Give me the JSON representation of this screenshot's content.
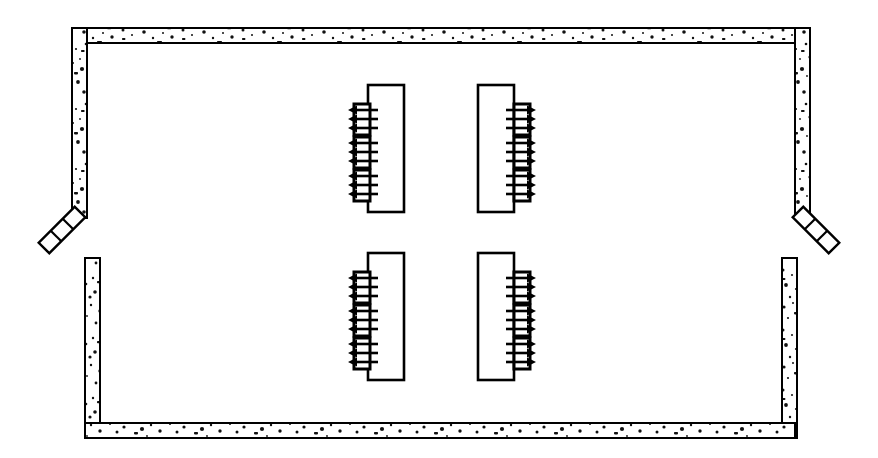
{
  "diagram": {
    "type": "technical-plan-drawing",
    "canvas": {
      "width": 878,
      "height": 458,
      "background": "#ffffff"
    },
    "style": {
      "line_color": "#000000",
      "fill_color": "#ffffff",
      "wall_texture": "speckled-concrete-stipple",
      "wall_line_width": 2,
      "unit_line_width": 2.2,
      "arrow_line_width": 2.6
    },
    "walls": {
      "name": "concrete-enclosure-wall",
      "thickness": 15,
      "outer": {
        "left": 72,
        "top": 28,
        "right": 810,
        "bottom": 438
      },
      "segments": [
        {
          "name": "top-wall",
          "orientation": "horizontal",
          "x": 72,
          "y": 28,
          "length": 738
        },
        {
          "name": "upper-left-wall",
          "orientation": "vertical",
          "x": 72,
          "y": 28,
          "length": 190
        },
        {
          "name": "upper-right-wall",
          "orientation": "vertical",
          "x": 795,
          "y": 28,
          "length": 190
        },
        {
          "name": "lower-left-wall",
          "orientation": "vertical",
          "x": 85,
          "y": 258,
          "length": 180
        },
        {
          "name": "lower-right-wall",
          "orientation": "vertical",
          "x": 782,
          "y": 258,
          "length": 180
        },
        {
          "name": "bottom-wall",
          "orientation": "horizontal",
          "x": 85,
          "y": 423,
          "length": 710
        }
      ],
      "openings": [
        {
          "name": "left-opening",
          "side": "left",
          "gap_top": 215,
          "gap_bottom": 258
        },
        {
          "name": "right-opening",
          "side": "right",
          "gap_top": 215,
          "gap_bottom": 258
        }
      ]
    },
    "deflectors": [
      {
        "name": "left-angled-deflector",
        "side": "left",
        "angle_deg": 48,
        "segment_count": 3,
        "start": {
          "x": 80,
          "y": 212
        },
        "end": {
          "x": 44,
          "y": 248
        }
      },
      {
        "name": "right-angled-deflector",
        "side": "right",
        "angle_deg": -48,
        "segment_count": 3,
        "start": {
          "x": 798,
          "y": 212
        },
        "end": {
          "x": 834,
          "y": 248
        }
      }
    ],
    "units": [
      {
        "name": "unit-top-left",
        "id": "U1",
        "row": "top",
        "column": "left",
        "orientation": "discharge-left",
        "body": {
          "x": 368,
          "y": 85,
          "width": 36,
          "height": 127
        },
        "outlet_count": 3,
        "outlets": [
          {
            "name": "outlet-1",
            "x": 354,
            "y": 104,
            "width": 16,
            "height": 31
          },
          {
            "name": "outlet-2",
            "x": 354,
            "y": 137,
            "width": 16,
            "height": 31
          },
          {
            "name": "outlet-3",
            "x": 354,
            "y": 170,
            "width": 16,
            "height": 31
          }
        ],
        "arrow_groups": [
          {
            "name": "flow-group-1",
            "direction": "left",
            "arrow_count": 3,
            "y_center": 119
          },
          {
            "name": "flow-group-2",
            "direction": "left",
            "arrow_count": 3,
            "y_center": 152
          },
          {
            "name": "flow-group-3",
            "direction": "left",
            "arrow_count": 3,
            "y_center": 185
          }
        ]
      },
      {
        "name": "unit-top-right",
        "id": "U2",
        "row": "top",
        "column": "right",
        "orientation": "discharge-right",
        "body": {
          "x": 478,
          "y": 85,
          "width": 36,
          "height": 127
        },
        "outlet_count": 3,
        "outlets": [
          {
            "name": "outlet-1",
            "x": 514,
            "y": 104,
            "width": 16,
            "height": 31
          },
          {
            "name": "outlet-2",
            "x": 514,
            "y": 137,
            "width": 16,
            "height": 31
          },
          {
            "name": "outlet-3",
            "x": 514,
            "y": 170,
            "width": 16,
            "height": 31
          }
        ],
        "arrow_groups": [
          {
            "name": "flow-group-1",
            "direction": "right",
            "arrow_count": 3,
            "y_center": 119
          },
          {
            "name": "flow-group-2",
            "direction": "right",
            "arrow_count": 3,
            "y_center": 152
          },
          {
            "name": "flow-group-3",
            "direction": "right",
            "arrow_count": 3,
            "y_center": 185
          }
        ]
      },
      {
        "name": "unit-bottom-left",
        "id": "U3",
        "row": "bottom",
        "column": "left",
        "orientation": "discharge-left",
        "body": {
          "x": 368,
          "y": 253,
          "width": 36,
          "height": 127
        },
        "outlet_count": 3,
        "outlets": [
          {
            "name": "outlet-1",
            "x": 354,
            "y": 272,
            "width": 16,
            "height": 31
          },
          {
            "name": "outlet-2",
            "x": 354,
            "y": 305,
            "width": 16,
            "height": 31
          },
          {
            "name": "outlet-3",
            "x": 354,
            "y": 338,
            "width": 16,
            "height": 31
          }
        ],
        "arrow_groups": [
          {
            "name": "flow-group-1",
            "direction": "left",
            "arrow_count": 3,
            "y_center": 287
          },
          {
            "name": "flow-group-2",
            "direction": "left",
            "arrow_count": 3,
            "y_center": 320
          },
          {
            "name": "flow-group-3",
            "direction": "left",
            "arrow_count": 3,
            "y_center": 353
          }
        ]
      },
      {
        "name": "unit-bottom-right",
        "id": "U4",
        "row": "bottom",
        "column": "right",
        "orientation": "discharge-right",
        "body": {
          "x": 478,
          "y": 253,
          "width": 36,
          "height": 127
        },
        "outlet_count": 3,
        "outlets": [
          {
            "name": "outlet-1",
            "x": 514,
            "y": 272,
            "width": 16,
            "height": 31
          },
          {
            "name": "outlet-2",
            "x": 514,
            "y": 305,
            "width": 16,
            "height": 31
          },
          {
            "name": "outlet-3",
            "x": 514,
            "y": 338,
            "width": 16,
            "height": 31
          }
        ],
        "arrow_groups": [
          {
            "name": "flow-group-1",
            "direction": "right",
            "arrow_count": 3,
            "y_center": 287
          },
          {
            "name": "flow-group-2",
            "direction": "right",
            "arrow_count": 3,
            "y_center": 320
          },
          {
            "name": "flow-group-3",
            "direction": "right",
            "arrow_count": 3,
            "y_center": 353
          }
        ]
      }
    ],
    "arrow_spec": {
      "shaft_length": 30,
      "vertical_spacing": 9,
      "head_length": 9,
      "head_half_width": 4.5,
      "gap_from_outlet": 6
    }
  }
}
